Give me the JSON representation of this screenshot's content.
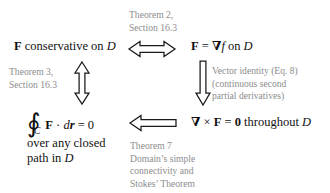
{
  "diagram": {
    "background_color": "#ffffff",
    "text_color": "#111111",
    "note_color": "#8d8d8d"
  },
  "nodes": {
    "conservative": {
      "field": "F",
      "text": "conservative on",
      "domain": "D"
    },
    "gradient": {
      "field": "F",
      "equals": "=",
      "nabla": "∇",
      "potential": "f",
      "on": "on",
      "domain": "D"
    },
    "integral": {
      "oint": "∮",
      "contour": "C",
      "body": "F · d",
      "field": "F",
      "differential": "d",
      "vector_r": "r",
      "equals_zero": "= 0",
      "line2": "over any closed",
      "line3_prefix": "path in",
      "line3_domain": "D"
    },
    "curl": {
      "nabla": "∇",
      "times": "×",
      "field": "F",
      "equals": "=",
      "zero": "0",
      "suffix": "throughout",
      "domain": "D"
    }
  },
  "notes": {
    "theorem2": {
      "line1": "Theorem 2,",
      "line2": "Section 16.3"
    },
    "theorem3": {
      "line1": "Theorem 3,",
      "line2": "Section 16.3"
    },
    "vector_identity": {
      "line1": "Vector identity (Eq. 8)",
      "line2": "(continuous second",
      "line3": "partial derivatives)"
    },
    "theorem7": {
      "line1": "Theorem 7",
      "line2": "Domain’s simple",
      "line3": "connectivity and",
      "line4": "Stokes’ Theorem"
    }
  },
  "arrows": {
    "biconditional": {
      "direction": "both-horizontal",
      "glyph": "⟺"
    },
    "vertical_left": {
      "direction": "both-vertical",
      "glyph": "⇕"
    },
    "vertical_right": {
      "direction": "down",
      "glyph": "⇓"
    },
    "leftward": {
      "direction": "left",
      "glyph": "⟸"
    }
  }
}
